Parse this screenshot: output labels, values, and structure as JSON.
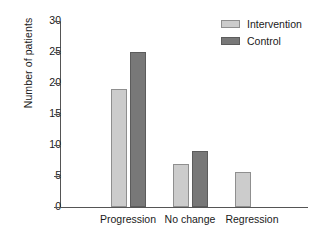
{
  "chart_data": {
    "type": "bar",
    "title": "",
    "xlabel": "",
    "ylabel": "Number of patients",
    "categories": [
      "Progression",
      "No change",
      "Regression"
    ],
    "series": [
      {
        "name": "Intervention",
        "color": "#cccccc",
        "values": [
          19,
          7,
          5.7
        ]
      },
      {
        "name": "Control",
        "color": "#787878",
        "values": [
          25,
          9,
          0
        ]
      }
    ],
    "ylim": [
      0,
      30
    ],
    "yticks": [
      0,
      5,
      10,
      15,
      20,
      25,
      30
    ],
    "ytick_labels": [
      "0",
      "5",
      "10",
      "15",
      "20",
      "25",
      "30"
    ],
    "grid": false,
    "legend_position": "top-right"
  }
}
